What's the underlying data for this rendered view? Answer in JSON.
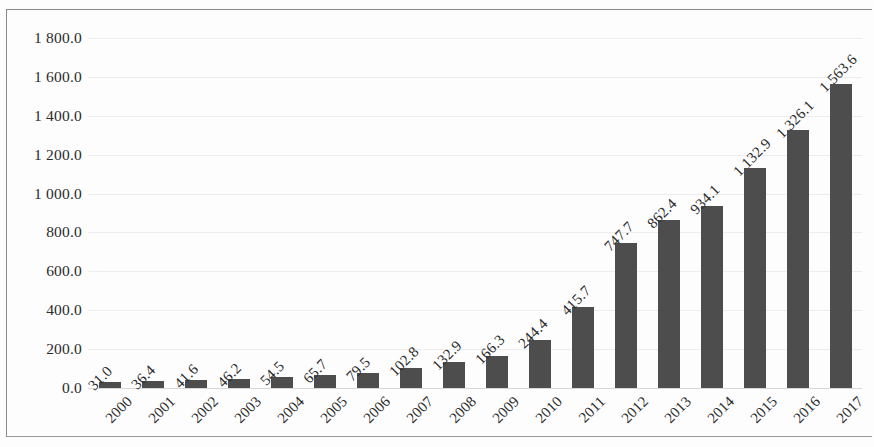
{
  "chart_data": {
    "type": "bar",
    "title": "",
    "subtitle": "",
    "xlabel": "",
    "ylabel": "",
    "categories": [
      "2000",
      "2001",
      "2002",
      "2003",
      "2004",
      "2005",
      "2006",
      "2007",
      "2008",
      "2009",
      "2010",
      "2011",
      "2012",
      "2013",
      "2014",
      "2015",
      "2016",
      "2017"
    ],
    "values": [
      31.0,
      36.4,
      41.6,
      46.2,
      54.5,
      65.7,
      79.5,
      102.8,
      132.9,
      166.3,
      244.4,
      415.7,
      747.7,
      862.4,
      934.1,
      1132.9,
      1326.1,
      1563.6
    ],
    "data_labels": [
      "31.0",
      "36.4",
      "41.6",
      "46.2",
      "54.5",
      "65.7",
      "79.5",
      "102.8",
      "132.9",
      "166.3",
      "244.4",
      "415.7",
      "747.7",
      "862.4",
      "934.1",
      "1 132.9",
      "1 326.1",
      "1 563.6"
    ],
    "ylim": [
      0,
      1800
    ],
    "ytick_values": [
      0,
      200,
      400,
      600,
      800,
      1000,
      1200,
      1400,
      1600,
      1800
    ],
    "ytick_labels": [
      "0.0",
      "200.0",
      "400.0",
      "600.0",
      "800.0",
      "1 000.0",
      "1 200.0",
      "1 400.0",
      "1 600.0",
      "1 800.0"
    ],
    "grid": true,
    "legend": "none",
    "series": [
      {
        "name": "",
        "color": "#4d4d4d",
        "values": [
          31.0,
          36.4,
          41.6,
          46.2,
          54.5,
          65.7,
          79.5,
          102.8,
          132.9,
          166.3,
          244.4,
          415.7,
          747.7,
          862.4,
          934.1,
          1132.9,
          1326.1,
          1563.6
        ]
      }
    ],
    "annotations": [],
    "label_rotation_deg": 45,
    "colors": {
      "bar": "#4d4d4d",
      "gridline": "#ededed",
      "text": "#2b2b2b",
      "background": "#fdfdfd",
      "border": "#8a8a8a"
    }
  }
}
